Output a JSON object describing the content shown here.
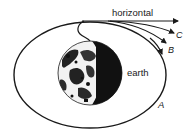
{
  "diagram": {
    "labels": {
      "horizontal": "horizontal",
      "earth": "earth",
      "path_a": "A",
      "path_b": "B",
      "path_c": "C"
    },
    "colors": {
      "stroke": "#1a1a1a",
      "background": "#ffffff",
      "earth_dark": "#111111",
      "earth_light": "#f2f2f2"
    }
  }
}
